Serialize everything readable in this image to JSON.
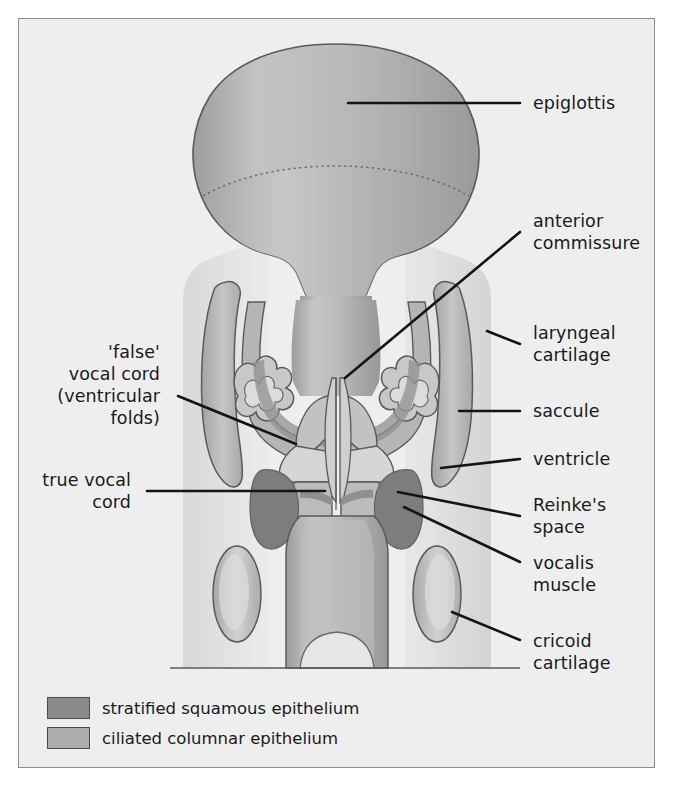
{
  "figure": {
    "background_color": "#eeeeee",
    "frame_color": "#8c8c8c"
  },
  "colors": {
    "stratified_squamous": "#8a8a8a",
    "ciliated_columnar": "#acacac",
    "cartilage_fill": "#b8b8b8",
    "lumen_light": "#e2e2e2",
    "outline": "#4a4a4a",
    "leader": "#141414",
    "text": "#1a1a1a"
  },
  "labels": {
    "right": [
      {
        "id": "epiglottis",
        "text": "epiglottis",
        "lines": [
          "epiglottis"
        ]
      },
      {
        "id": "anterior-commissure",
        "text": "anterior commissure",
        "lines": [
          "anterior",
          "commissure"
        ]
      },
      {
        "id": "laryngeal-cartilage",
        "text": "laryngeal cartilage",
        "lines": [
          "laryngeal",
          "cartilage"
        ]
      },
      {
        "id": "saccule",
        "text": "saccule",
        "lines": [
          "saccule"
        ]
      },
      {
        "id": "ventricle",
        "text": "ventricle",
        "lines": [
          "ventricle"
        ]
      },
      {
        "id": "reinkes-space",
        "text": "Reinke's space",
        "lines": [
          "Reinke's",
          "space"
        ]
      },
      {
        "id": "vocalis-muscle",
        "text": "vocalis muscle",
        "lines": [
          "vocalis",
          "muscle"
        ]
      },
      {
        "id": "cricoid-cartilage",
        "text": "cricoid cartilage",
        "lines": [
          "cricoid",
          "cartilage"
        ]
      }
    ],
    "left": [
      {
        "id": "false-vocal-cord",
        "text": "'false' vocal cord (ventricular folds)",
        "lines": [
          "'false'",
          "vocal cord",
          "(ventricular",
          "folds)"
        ]
      },
      {
        "id": "true-vocal-cord",
        "text": "true vocal cord",
        "lines": [
          "true vocal",
          "cord"
        ]
      }
    ]
  },
  "label_text": {
    "epiglottis_l1": "epiglottis",
    "anterior_l1": "anterior",
    "anterior_l2": "commissure",
    "laryngeal_l1": "laryngeal",
    "laryngeal_l2": "cartilage",
    "saccule_l1": "saccule",
    "ventricle_l1": "ventricle",
    "reinkes_l1": "Reinke's",
    "reinkes_l2": "space",
    "vocalis_l1": "vocalis",
    "vocalis_l2": "muscle",
    "cricoid_l1": "cricoid",
    "cricoid_l2": "cartilage",
    "false_l1": "'false'",
    "false_l2": "vocal cord",
    "false_l3": "(ventricular",
    "false_l4": "folds)",
    "true_l1": "true vocal",
    "true_l2": "cord"
  },
  "legend": {
    "items": [
      {
        "id": "stratified-squamous",
        "label": "stratified squamous epithelium",
        "color": "#8a8a8a"
      },
      {
        "id": "ciliated-columnar",
        "label": "ciliated columnar epithelium",
        "color": "#acacac"
      }
    ],
    "item0_label": "stratified squamous epithelium",
    "item1_label": "ciliated columnar epithelium"
  }
}
